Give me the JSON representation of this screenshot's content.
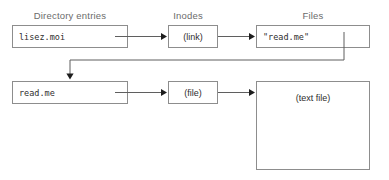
{
  "diagram": {
    "width": 389,
    "height": 180,
    "background_color": "#ffffff",
    "border_color": "#8d8d8d",
    "line_color": "#5f5f5f",
    "text_color": "#2e2e2e",
    "header_color": "#6b6b6b"
  },
  "headers": [
    {
      "label": "Directory entries",
      "x": 70,
      "y": 10
    },
    {
      "label": "Inodes",
      "x": 188,
      "y": 10
    },
    {
      "label": "Files",
      "x": 313,
      "y": 10
    }
  ],
  "nodes": [
    {
      "id": "dir-entry-lisez-moi",
      "label": "lisez.moi",
      "style": "mono",
      "x": 12,
      "y": 25,
      "w": 116,
      "h": 23
    },
    {
      "id": "inode-link",
      "label": "(link)",
      "style": "centered",
      "x": 168,
      "y": 25,
      "w": 50,
      "h": 23
    },
    {
      "id": "file-read-me-target",
      "label": "\"read.me\"",
      "style": "mono",
      "x": 256,
      "y": 25,
      "w": 114,
      "h": 23
    },
    {
      "id": "dir-entry-read-me",
      "label": "read.me",
      "style": "mono",
      "x": 12,
      "y": 81,
      "w": 116,
      "h": 23
    },
    {
      "id": "inode-file",
      "label": "(file)",
      "style": "centered",
      "x": 168,
      "y": 81,
      "w": 50,
      "h": 23
    },
    {
      "id": "file-text-file",
      "label": "(text file)",
      "style": "top-centered",
      "x": 256,
      "y": 81,
      "w": 114,
      "h": 89
    }
  ],
  "edges": [
    {
      "id": "edge-lisez-moi-to-link",
      "from": "dir-entry-lisez-moi",
      "to": "inode-link",
      "path": "M 115 36.5 L 165 36.5",
      "arrow": {
        "x": 167,
        "y": 36.5,
        "dir": "right"
      }
    },
    {
      "id": "edge-link-to-read-me-target",
      "from": "inode-link",
      "to": "file-read-me-target",
      "path": "M 218 36.5 L 253 36.5",
      "arrow": {
        "x": 255,
        "y": 36.5,
        "dir": "right"
      }
    },
    {
      "id": "edge-read-me-target-to-dir-entry-read-me",
      "from": "file-read-me-target",
      "to": "dir-entry-read-me",
      "path": "M 344 32 L 344 60 L 70 60 L 70 77",
      "arrow": {
        "x": 70,
        "y": 79.5,
        "dir": "down"
      }
    },
    {
      "id": "edge-read-me-to-file",
      "from": "dir-entry-read-me",
      "to": "inode-file",
      "path": "M 115 92.5 L 165 92.5",
      "arrow": {
        "x": 167,
        "y": 92.5,
        "dir": "right"
      }
    },
    {
      "id": "edge-file-to-text-file",
      "from": "inode-file",
      "to": "file-text-file",
      "path": "M 218 92.5 L 253 92.5",
      "arrow": {
        "x": 255,
        "y": 92.5,
        "dir": "right"
      }
    }
  ]
}
